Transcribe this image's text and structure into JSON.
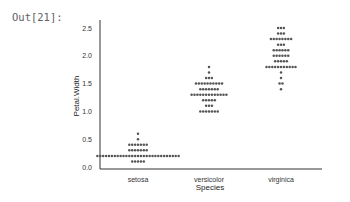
{
  "cell": {
    "prompt": "Out[21]:"
  },
  "chart_data": {
    "type": "swarm",
    "title": "",
    "xlabel": "Species",
    "ylabel": "Petal.Width",
    "categories": [
      "setosa",
      "versicolor",
      "virginica"
    ],
    "yticks": [
      "0.0",
      "0.5",
      "1.0",
      "1.5",
      "2.0",
      "2.5"
    ],
    "ylim": [
      0.0,
      2.6
    ],
    "grid": false,
    "dot_color": "#555555",
    "series": [
      {
        "name": "setosa",
        "values_counts": {
          "0.1": 5,
          "0.2": 29,
          "0.3": 7,
          "0.4": 7,
          "0.5": 1,
          "0.6": 1
        }
      },
      {
        "name": "versicolor",
        "values_counts": {
          "1.0": 7,
          "1.1": 3,
          "1.2": 5,
          "1.3": 13,
          "1.4": 7,
          "1.5": 10,
          "1.6": 3,
          "1.7": 1,
          "1.8": 1
        }
      },
      {
        "name": "virginica",
        "values_counts": {
          "1.4": 1,
          "1.5": 2,
          "1.6": 1,
          "1.7": 1,
          "1.8": 11,
          "1.9": 5,
          "2.0": 6,
          "2.1": 6,
          "2.2": 3,
          "2.3": 8,
          "2.4": 3,
          "2.5": 3
        }
      }
    ]
  }
}
